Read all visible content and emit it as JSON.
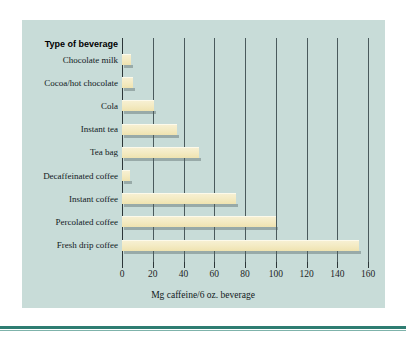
{
  "chart_data": {
    "type": "bar",
    "orientation": "horizontal",
    "title": "",
    "xlabel": "Mg caffeine/6 oz. beverage",
    "ylabel": "Type of beverage",
    "categories": [
      "Chocolate milk",
      "Cocoa/hot chocolate",
      "Cola",
      "Instant tea",
      "Tea bag",
      "Decaffeinated coffee",
      "Instant coffee",
      "Percolated coffee",
      "Fresh drip coffee"
    ],
    "values": [
      6,
      7,
      21,
      36,
      50,
      5,
      74,
      100,
      154
    ],
    "xlim": [
      0,
      160
    ],
    "xticks": [
      0,
      20,
      40,
      60,
      80,
      100,
      120,
      140,
      160
    ],
    "xtick_labels": [
      "0",
      "20",
      "40",
      "60",
      "80",
      "100",
      "120",
      "140",
      "160"
    ],
    "grid": true,
    "grid_axis": "x",
    "legend": false,
    "bar_color": "#f4ebc4",
    "panel_color": "#c8dcd8",
    "axis_color": "#2c3638",
    "rule_color": "#2f7d72"
  },
  "axis_header_label": "Type of beverage"
}
